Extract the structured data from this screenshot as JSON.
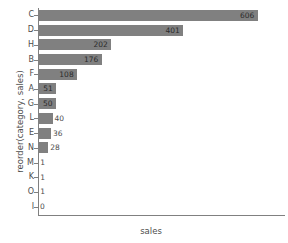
{
  "chart_data": {
    "type": "bar",
    "orientation": "horizontal",
    "title": "",
    "xlabel": "sales",
    "ylabel": "reorder(category, sales)",
    "categories": [
      "C",
      "D",
      "H",
      "B",
      "F",
      "A",
      "G",
      "L",
      "E",
      "N",
      "M",
      "K",
      "O",
      "I"
    ],
    "values": [
      606,
      401,
      202,
      176,
      108,
      51,
      50,
      40,
      36,
      28,
      1,
      1,
      1,
      0
    ],
    "value_labels": [
      "606",
      "401",
      "202",
      "176",
      "108",
      "51",
      "50",
      "40",
      "36",
      "28",
      "1",
      "1",
      "1",
      "0"
    ],
    "xlim": [
      0,
      640
    ],
    "grid": false,
    "legend": null,
    "bar_color": "#808080",
    "axis_color": "#808080",
    "text_color": "#4d4d4d",
    "background": "#ffffff"
  },
  "axes": {
    "x_title": "sales",
    "y_title": "reorder(category, sales)"
  }
}
